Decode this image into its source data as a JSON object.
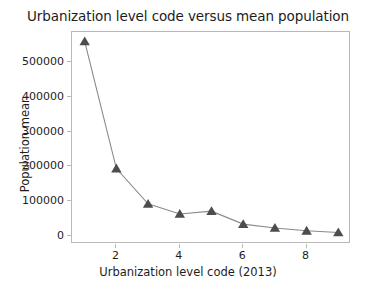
{
  "chart_data": {
    "type": "line",
    "title": "Urbanization level code versus mean population",
    "xlabel": "Urbanization level code (2013)",
    "ylabel": "Population mean",
    "x": [
      1,
      2,
      3,
      4,
      5,
      6,
      7,
      8,
      9
    ],
    "values": [
      558000,
      194000,
      93000,
      64000,
      72000,
      35000,
      24000,
      16000,
      11000
    ],
    "series": [
      {
        "name": "Population mean",
        "values": [
          558000,
          194000,
          93000,
          64000,
          72000,
          35000,
          24000,
          16000,
          11000
        ]
      }
    ],
    "xlim": [
      0.6,
      9.4
    ],
    "ylim": [
      -22000,
      585000
    ],
    "xticks": [
      2,
      4,
      6,
      8
    ],
    "xtick_labels": [
      "2",
      "4",
      "6",
      "8"
    ],
    "yticks": [
      0,
      100000,
      200000,
      300000,
      400000,
      500000
    ],
    "ytick_labels": [
      "0",
      "100000",
      "200000",
      "300000",
      "400000",
      "500000"
    ],
    "grid": false,
    "legend": null,
    "marker": "triangle-up",
    "line_color": "#8a8a8a",
    "marker_color": "#4d4d4d",
    "frame_color": "#b9b9b9",
    "background": "#ffffff"
  }
}
